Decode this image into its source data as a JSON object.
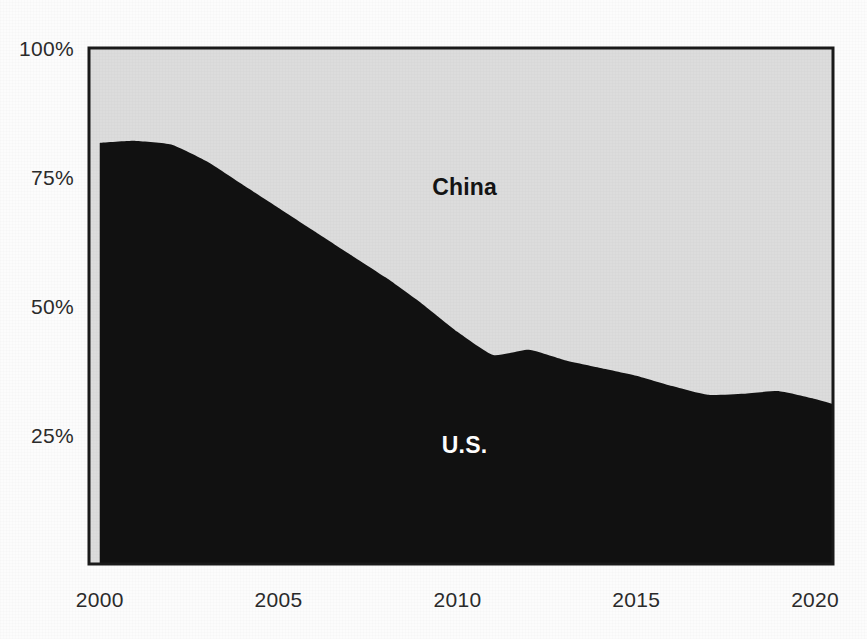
{
  "title": {
    "text_clipped": "",
    "note": "title row is cropped off the top of the screenshot"
  },
  "labels": {
    "china": "China",
    "us": "U.S."
  },
  "axis": {
    "y_ticks": [
      "100%",
      "75%",
      "50%",
      "25%"
    ],
    "x_ticks": [
      "2000",
      "2005",
      "2010",
      "2015",
      "2020"
    ]
  },
  "colors": {
    "us_area": "#111111",
    "china_area": "#dcdcdc",
    "plot_border": "#1a1a1a",
    "gridline": "#c9c9c9",
    "page_background": "#fcfcfc",
    "tick_text": "#2b2b2b",
    "china_label_text": "#141414",
    "us_label_text": "#ffffff"
  },
  "chart_data": {
    "type": "area",
    "title": "",
    "subtitle": "",
    "xlabel": "",
    "ylabel": "",
    "stacked": true,
    "normalized_percent": true,
    "grid": true,
    "legend_position": "inline-annotation",
    "xlim": [
      1999.7,
      2020.5
    ],
    "ylim": [
      0,
      100
    ],
    "x_tick_values": [
      2000,
      2005,
      2010,
      2015,
      2020
    ],
    "y_tick_values": [
      25,
      50,
      75,
      100
    ],
    "x": [
      2000,
      2001,
      2002,
      2003,
      2004,
      2005,
      2006,
      2007,
      2008,
      2009,
      2010,
      2011,
      2012,
      2013,
      2014,
      2015,
      2016,
      2017,
      2018,
      2019,
      2020,
      2020.5
    ],
    "series": [
      {
        "name": "U.S.",
        "color": "#111111",
        "values": [
          81.6,
          82.0,
          81.3,
          78.0,
          73.5,
          69.0,
          64.5,
          60.0,
          55.5,
          50.5,
          45.0,
          40.5,
          41.5,
          39.5,
          38.0,
          36.5,
          34.5,
          32.8,
          33.0,
          33.5,
          32.0,
          31.0
        ]
      },
      {
        "name": "China",
        "color": "#dcdcdc",
        "values": [
          18.4,
          18.0,
          18.7,
          22.0,
          26.5,
          31.0,
          35.5,
          40.0,
          44.5,
          49.5,
          55.0,
          59.5,
          58.5,
          60.5,
          62.0,
          63.5,
          65.5,
          67.2,
          67.0,
          66.5,
          68.0,
          69.0
        ]
      }
    ],
    "annotations": [
      {
        "text": "China",
        "x": 2010.2,
        "y": 71.5
      },
      {
        "text": "U.S.",
        "x": 2010.2,
        "y": 21.5
      }
    ]
  }
}
